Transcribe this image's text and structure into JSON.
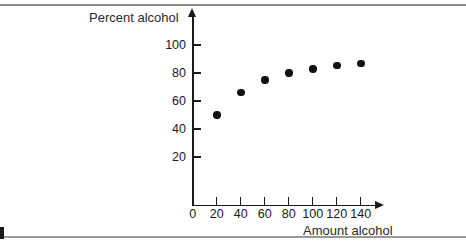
{
  "figure": {
    "background_color": "#ffffff",
    "ink_color": "#1a1a1a"
  },
  "chart_data": {
    "type": "scatter",
    "title": "",
    "xlabel": "Amount alcohol",
    "ylabel": "Percent alcohol",
    "x": [
      20,
      40,
      60,
      80,
      100,
      120,
      140
    ],
    "values": [
      50,
      66,
      75,
      80,
      83,
      85.5,
      87
    ],
    "points": [
      {
        "x": 20,
        "y": 50
      },
      {
        "x": 40,
        "y": 66
      },
      {
        "x": 60,
        "y": 75
      },
      {
        "x": 80,
        "y": 80
      },
      {
        "x": 100,
        "y": 83
      },
      {
        "x": 120,
        "y": 85.5
      },
      {
        "x": 140,
        "y": 87
      }
    ],
    "xlim": [
      0,
      155
    ],
    "ylim": [
      0,
      110
    ],
    "xticks": [
      0,
      20,
      40,
      60,
      80,
      100,
      120,
      140
    ],
    "xtick_labels": [
      "0",
      "20",
      "40",
      "60",
      "80",
      "100",
      "120",
      "140"
    ],
    "yticks": [
      20,
      40,
      60,
      80,
      100
    ],
    "ytick_labels": [
      "20",
      "40",
      "60",
      "80",
      "100"
    ],
    "grid": false,
    "legend": null,
    "marker": "filled-circle",
    "marker_color": "#111111"
  }
}
